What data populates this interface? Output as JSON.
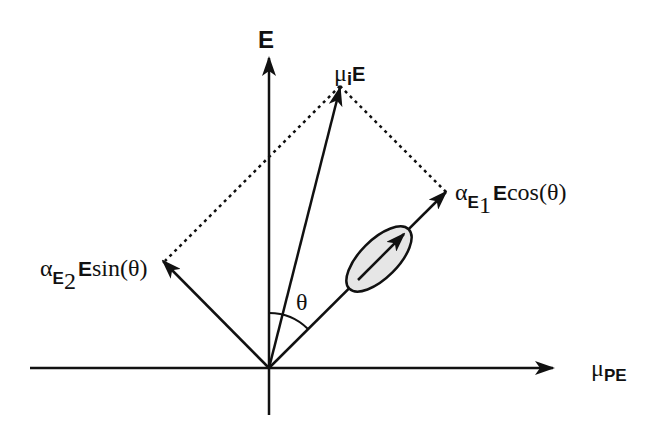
{
  "diagram": {
    "axes": {
      "vertical": {
        "label": "E"
      },
      "horizontal": {
        "label_symbol": "μ",
        "label_sub": "PE"
      }
    },
    "vectors": {
      "resultant": {
        "label_symbol": "μ",
        "label_sub_i": "i",
        "label_sub_bold": "E"
      },
      "component_1": {
        "alpha": "α",
        "sub": "E",
        "subsub": "1",
        "bold": "E",
        "func": "cos(θ)"
      },
      "component_2": {
        "alpha": "α",
        "sub": "E",
        "subsub": "2",
        "bold": "E",
        "func": "sin(θ)"
      }
    },
    "angle_label": "θ",
    "colors": {
      "line": "#111111",
      "ellipse_fill": "#e6e6e6"
    }
  }
}
